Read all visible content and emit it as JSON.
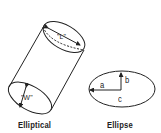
{
  "diagram": {
    "elliptical": {
      "caption": "Elliptical",
      "length_label": "\"L\"",
      "width_label": "\"W\""
    },
    "ellipse": {
      "caption": "Ellipse",
      "axis_a": "a",
      "axis_b": "b",
      "center": "c"
    },
    "colors": {
      "stroke": "#222222",
      "background": "#ffffff"
    }
  }
}
